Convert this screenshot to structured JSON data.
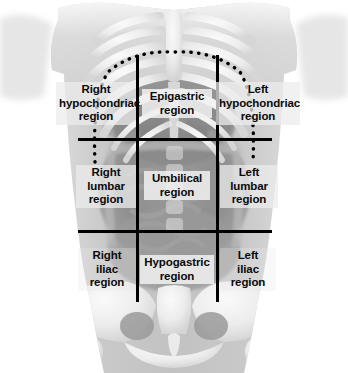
{
  "figure": {
    "width": 348,
    "height": 373,
    "background_color": "#ffffff",
    "line_color": "#000000",
    "label_text_color": "#0a0a0a"
  },
  "regions": [
    {
      "id": "right-hypochondriac",
      "label": "Right\nhypochondriac\nregion",
      "row": "upper",
      "column": "right"
    },
    {
      "id": "epigastric",
      "label": "Epigastric\nregion",
      "row": "upper",
      "column": "center"
    },
    {
      "id": "left-hypochondriac",
      "label": "Left\nhypochondriac\nregion",
      "row": "upper",
      "column": "left"
    },
    {
      "id": "right-lumbar",
      "label": "Right\nlumbar\nregion",
      "row": "middle",
      "column": "right"
    },
    {
      "id": "umbilical",
      "label": "Umbilical\nregion",
      "row": "middle",
      "column": "center"
    },
    {
      "id": "left-lumbar",
      "label": "Left\nlumbar\nregion",
      "row": "middle",
      "column": "left"
    },
    {
      "id": "right-iliac",
      "label": "Right\niliac\nregion",
      "row": "lower",
      "column": "right"
    },
    {
      "id": "hypogastric",
      "label": "Hypogastric\nregion",
      "row": "lower",
      "column": "center"
    },
    {
      "id": "left-iliac",
      "label": "Left\niliac\nregion",
      "row": "lower",
      "column": "left"
    }
  ],
  "grid": {
    "vertical_lines": [
      {
        "id": "left-midclavicular-line",
        "x": 136,
        "y_top": 55,
        "y_bottom": 302
      },
      {
        "id": "right-midclavicular-line",
        "x": 216,
        "y_top": 55,
        "y_bottom": 302
      }
    ],
    "horizontal_lines": [
      {
        "id": "subcostal-line",
        "y": 138,
        "x_left": 78,
        "x_right": 272
      },
      {
        "id": "intertubercular-line",
        "y": 230,
        "x_left": 78,
        "x_right": 272
      }
    ]
  },
  "diaphragm": {
    "id": "diaphragm-outline",
    "style": "dotted",
    "apex_y": 53,
    "left_x": 95,
    "right_x": 255,
    "tail_bottom_y": 162
  }
}
